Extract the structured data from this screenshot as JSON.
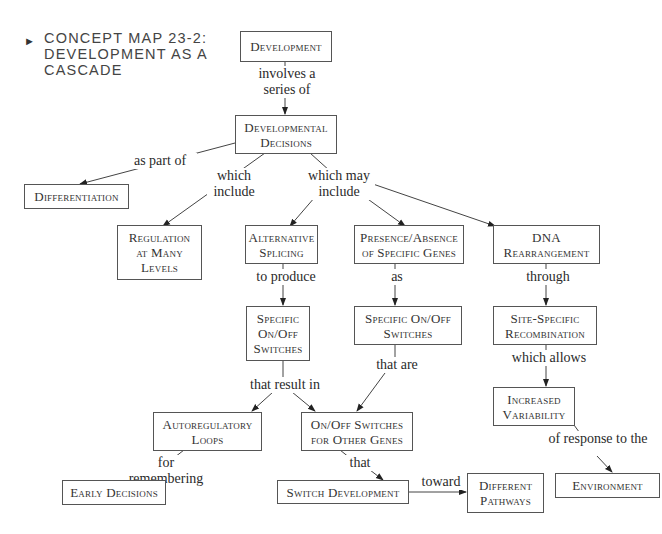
{
  "title": {
    "marker": "►",
    "lines": [
      "CONCEPT MAP 23-2:",
      "DEVELOPMENT AS A",
      "CASCADE"
    ]
  },
  "nodes": {
    "development": "Development",
    "developmental_decisions": "Developmental\nDecisions",
    "differentiation": "Differentiation",
    "regulation": "Regulation\nat Many\nLevels",
    "alternative_splicing": "Alternative\nSplicing",
    "presence_absence": "Presence/Absence\nof Specific Genes",
    "dna_rearrangement": "DNA\nRearrangement",
    "specific_switches_left": "Specific\nOn/Off\nSwitches",
    "specific_switches_mid": "Specific On/Off\nSwitches",
    "site_specific": "Site-Specific\nRecombination",
    "autoregulatory_loops": "Autoregulatory\nLoops",
    "switches_other_genes": "On/Off Switches\nfor Other Genes",
    "increased_variability": "Increased\nVariability",
    "early_decisions": "Early Decisions",
    "switch_development": "Switch Development",
    "different_pathways": "Different\nPathways",
    "environment": "Environment"
  },
  "links": {
    "involves": "involves a\nseries of",
    "as_part_of": "as part of",
    "which_include": "which\ninclude",
    "which_may_include": "which may\ninclude",
    "to_produce": "to produce",
    "as": "as",
    "through": "through",
    "that_result_in": "that result in",
    "that_are": "that are",
    "which_allows": "which allows",
    "for_remembering": "for remembering",
    "that": "that",
    "of_response": "of response to the",
    "toward": "toward"
  },
  "colors": {
    "stroke": "#444444",
    "text": "#2a2a2a",
    "background": "#ffffff"
  }
}
